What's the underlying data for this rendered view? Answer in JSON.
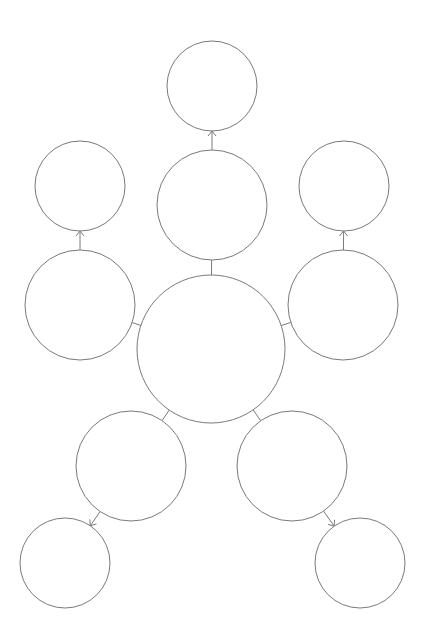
{
  "diagram": {
    "type": "bubble-map",
    "stroke_color": "#7a7a7a",
    "background": "#ffffff",
    "nodes": [
      {
        "id": "center",
        "cx": 211,
        "cy": 349,
        "r": 74,
        "label": ""
      },
      {
        "id": "top-mid",
        "cx": 212,
        "cy": 205,
        "r": 55,
        "label": ""
      },
      {
        "id": "top",
        "cx": 212,
        "cy": 86,
        "r": 45,
        "label": ""
      },
      {
        "id": "left-mid",
        "cx": 80,
        "cy": 305,
        "r": 55,
        "label": ""
      },
      {
        "id": "left-top",
        "cx": 80,
        "cy": 186,
        "r": 45,
        "label": ""
      },
      {
        "id": "right-mid",
        "cx": 343,
        "cy": 305,
        "r": 55,
        "label": ""
      },
      {
        "id": "right-top",
        "cx": 344,
        "cy": 186,
        "r": 45,
        "label": ""
      },
      {
        "id": "lower-left",
        "cx": 131,
        "cy": 466,
        "r": 55,
        "label": ""
      },
      {
        "id": "bottom-left",
        "cx": 65,
        "cy": 563,
        "r": 45,
        "label": ""
      },
      {
        "id": "lower-right",
        "cx": 292,
        "cy": 466,
        "r": 55,
        "label": ""
      },
      {
        "id": "bottom-right",
        "cx": 360,
        "cy": 563,
        "r": 45,
        "label": ""
      }
    ],
    "edges": [
      {
        "from": "center",
        "to": "top-mid",
        "arrow": false
      },
      {
        "from": "center",
        "to": "left-mid",
        "arrow": false
      },
      {
        "from": "center",
        "to": "right-mid",
        "arrow": false
      },
      {
        "from": "center",
        "to": "lower-left",
        "arrow": false
      },
      {
        "from": "center",
        "to": "lower-right",
        "arrow": false
      },
      {
        "from": "top-mid",
        "to": "top",
        "arrow": true
      },
      {
        "from": "left-mid",
        "to": "left-top",
        "arrow": true
      },
      {
        "from": "right-mid",
        "to": "right-top",
        "arrow": true
      },
      {
        "from": "lower-left",
        "to": "bottom-left",
        "arrow": true
      },
      {
        "from": "lower-right",
        "to": "bottom-right",
        "arrow": true
      }
    ]
  }
}
